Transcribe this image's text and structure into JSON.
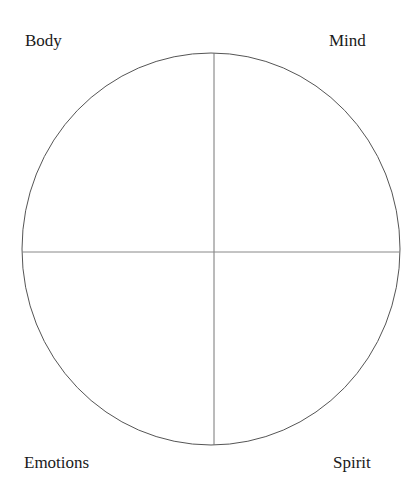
{
  "quadrants": {
    "top_left": "Body",
    "top_right": "Mind",
    "bottom_left": "Emotions",
    "bottom_right": "Spirit"
  },
  "colors": {
    "stroke": "#555555",
    "text": "#1a1a1a",
    "background": "#ffffff"
  }
}
